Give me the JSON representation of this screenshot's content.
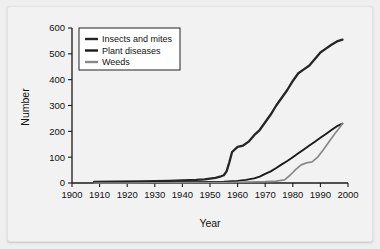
{
  "chart_data": {
    "type": "line",
    "title": "",
    "xlabel": "Year",
    "ylabel": "Number",
    "xlim": [
      1900,
      2000
    ],
    "ylim": [
      0,
      600
    ],
    "grid": false,
    "legend_position": "top-left",
    "xticks": [
      "1900",
      "1910",
      "1920",
      "1930",
      "1940",
      "1950",
      "1960",
      "1970",
      "1980",
      "1990",
      "2000"
    ],
    "yticks": [
      "0",
      "100",
      "200",
      "300",
      "400",
      "500",
      "600"
    ],
    "series": [
      {
        "name": "Insects and mites",
        "color": "#262626",
        "x": [
          1908,
          1915,
          1925,
          1935,
          1940,
          1945,
          1948,
          1952,
          1954,
          1955,
          1956,
          1957,
          1958,
          1960,
          1962,
          1964,
          1966,
          1968,
          1970,
          1972,
          1974,
          1976,
          1978,
          1980,
          1982,
          1984,
          1986,
          1988,
          1990,
          1992,
          1994,
          1996,
          1998
        ],
        "values": [
          4,
          5,
          6,
          8,
          10,
          12,
          14,
          20,
          26,
          30,
          45,
          80,
          120,
          140,
          145,
          160,
          185,
          205,
          235,
          265,
          300,
          330,
          360,
          395,
          425,
          440,
          455,
          480,
          505,
          520,
          535,
          548,
          555
        ]
      },
      {
        "name": "Plant diseases",
        "color": "#1a1a1a",
        "x": [
          1908,
          1920,
          1930,
          1940,
          1950,
          1955,
          1960,
          1963,
          1966,
          1968,
          1970,
          1972,
          1974,
          1976,
          1978,
          1980,
          1982,
          1984,
          1986,
          1988,
          1990,
          1992,
          1994,
          1996,
          1998
        ],
        "values": [
          1,
          2,
          2,
          3,
          4,
          5,
          8,
          12,
          18,
          25,
          35,
          45,
          58,
          72,
          85,
          100,
          115,
          130,
          145,
          160,
          175,
          190,
          205,
          220,
          230
        ]
      },
      {
        "name": "Weeds",
        "color": "#8a8a8a",
        "x": [
          1908,
          1920,
          1930,
          1940,
          1950,
          1957,
          1962,
          1966,
          1970,
          1974,
          1977,
          1979,
          1981,
          1983,
          1985,
          1987,
          1989,
          1991,
          1993,
          1995,
          1997,
          1998
        ],
        "values": [
          0,
          0,
          1,
          1,
          2,
          2,
          3,
          4,
          5,
          7,
          12,
          30,
          52,
          70,
          78,
          82,
          100,
          128,
          158,
          188,
          215,
          230
        ]
      }
    ]
  },
  "legend": {
    "items": [
      {
        "label": "Insects and mites"
      },
      {
        "label": "Plant diseases"
      },
      {
        "label": "Weeds"
      }
    ]
  },
  "axes": {
    "x_title": "Year",
    "y_title": "Number"
  }
}
